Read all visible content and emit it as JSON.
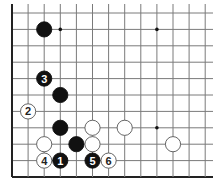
{
  "diagram": {
    "type": "go-problem",
    "grid": {
      "cols_x": [
        12,
        28.1,
        44.2,
        60.3,
        76.4,
        92.5,
        108.6,
        124.7,
        140.8,
        156.9,
        173,
        189.1,
        205.2
      ],
      "rows_y": [
        13,
        29.4,
        45.8,
        62.2,
        78.6,
        95,
        111.4,
        127.8,
        144.2,
        160.6,
        177
      ],
      "line_right_x": 213,
      "line_top_y": 4,
      "line_color": "#7a7a7a",
      "border_color": "#222222"
    },
    "star_points": [
      {
        "col": 3,
        "row": 1
      },
      {
        "col": 9,
        "row": 1
      },
      {
        "col": 9,
        "row": 7
      }
    ],
    "stones": [
      {
        "color": "black",
        "col": 2,
        "row": 1,
        "label": ""
      },
      {
        "color": "black",
        "col": 2,
        "row": 4,
        "label": "3"
      },
      {
        "color": "black",
        "col": 3,
        "row": 5,
        "label": ""
      },
      {
        "color": "white",
        "col": 1,
        "row": 6,
        "label": "2"
      },
      {
        "color": "black",
        "col": 3,
        "row": 7,
        "label": ""
      },
      {
        "color": "white",
        "col": 5,
        "row": 7,
        "label": ""
      },
      {
        "color": "white",
        "col": 7,
        "row": 7,
        "label": ""
      },
      {
        "color": "white",
        "col": 10,
        "row": 8,
        "label": ""
      },
      {
        "color": "white",
        "col": 2,
        "row": 8,
        "label": ""
      },
      {
        "color": "black",
        "col": 4,
        "row": 8,
        "label": ""
      },
      {
        "color": "white",
        "col": 5,
        "row": 8,
        "label": ""
      },
      {
        "color": "white",
        "col": 2,
        "row": 9,
        "label": "4"
      },
      {
        "color": "black",
        "col": 3,
        "row": 9,
        "label": "1"
      },
      {
        "color": "black",
        "col": 5,
        "row": 9,
        "label": "5"
      },
      {
        "color": "white",
        "col": 6,
        "row": 9,
        "label": "6"
      }
    ]
  }
}
